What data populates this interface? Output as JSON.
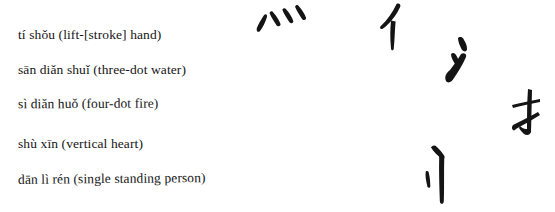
{
  "page": {
    "background": "#ffffff",
    "ink": "#161616"
  },
  "labels": [
    {
      "text": "tí shǒu (lift-[stroke] hand)"
    },
    {
      "text": "sān diǎn shuǐ (three-dot water)"
    },
    {
      "text": "sì diǎn huǒ (four-dot fire)"
    },
    {
      "text": "shù xīn (vertical heart)"
    },
    {
      "text": "dān lì rén (single standing person)"
    }
  ],
  "glyphs": [
    {
      "name": "four-dot-fire",
      "char": "灬"
    },
    {
      "name": "single-person",
      "char": "亻"
    },
    {
      "name": "three-dot-water",
      "char": "氵"
    },
    {
      "name": "hand",
      "char": "扌"
    },
    {
      "name": "vertical-heart",
      "char": "忄"
    }
  ]
}
